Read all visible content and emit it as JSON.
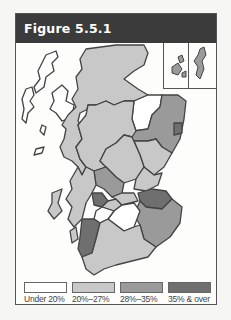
{
  "figure": {
    "title": "Figure 5.5.1"
  },
  "legend": {
    "items": [
      {
        "label": "Under 20%",
        "color": "#ffffff"
      },
      {
        "label": "20%–27%",
        "color": "#c8c8c8"
      },
      {
        "label": "28%–35%",
        "color": "#9a9a9a"
      },
      {
        "label": "35% & over",
        "color": "#6f6f6f"
      }
    ]
  },
  "map": {
    "subject": "Scotland",
    "insets": [
      "Orkney",
      "Shetland"
    ],
    "border_color": "#444444"
  }
}
